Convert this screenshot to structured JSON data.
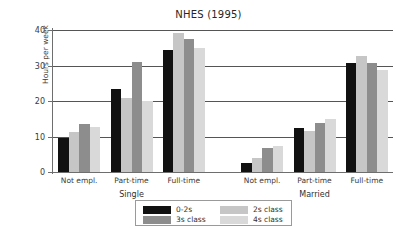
{
  "chart_data": {
    "type": "bar",
    "title": "NHES (1995)",
    "xlabel": "",
    "ylabel": "Hours per week",
    "ylim": [
      0,
      40
    ],
    "yticks": [
      0,
      10,
      20,
      30,
      40
    ],
    "ytick_labels": [
      "0",
      "10",
      "20",
      "30",
      "40"
    ],
    "grid": true,
    "legend_position": "below-center",
    "grouping": "grouped",
    "group_labels": [
      "Single",
      "Married"
    ],
    "categories": [
      "Not empl.",
      "Part-time",
      "Full-time",
      "Not empl.",
      "Part-time",
      "Full-time"
    ],
    "group_of_category": [
      "Single",
      "Single",
      "Single",
      "Married",
      "Married",
      "Married"
    ],
    "series": [
      {
        "name": "0-2s",
        "color": "#111111",
        "values": [
          9.5,
          23.4,
          34.5,
          2.4,
          12.4,
          30.7
        ]
      },
      {
        "name": "2s class",
        "color": "#c6c6c6",
        "values": [
          11.2,
          20.9,
          39.1,
          4.0,
          11.6,
          32.8
        ]
      },
      {
        "name": "3s class",
        "color": "#8d8d8d",
        "values": [
          13.6,
          31.0,
          37.6,
          6.8,
          13.7,
          30.7
        ]
      },
      {
        "name": "4s class",
        "color": "#d9d9d9",
        "values": [
          12.8,
          20.0,
          34.9,
          7.3,
          14.9,
          28.6
        ]
      }
    ]
  },
  "legend": {
    "entries": [
      {
        "label": "0-2s",
        "color": "#111111"
      },
      {
        "label": "2s class",
        "color": "#c6c6c6"
      },
      {
        "label": "3s class",
        "color": "#8d8d8d"
      },
      {
        "label": "4s class",
        "color": "#d9d9d9"
      }
    ]
  },
  "colors": {
    "background": "#ffffff",
    "axis": "#6e6e6e",
    "grid": "#555555",
    "text": "#333333"
  }
}
